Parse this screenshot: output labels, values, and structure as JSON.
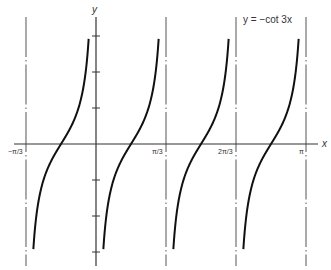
{
  "chart_data": {
    "type": "line",
    "title": "y = −cot 3x",
    "xlabel": "x",
    "ylabel": "y",
    "function": "y = -cot(3x)",
    "x_ticks": [
      {
        "value": -1.0472,
        "label": "−π/3"
      },
      {
        "value": 1.0472,
        "label": "π/3"
      },
      {
        "value": 2.0944,
        "label": "2π/3"
      },
      {
        "value": 3.1416,
        "label": "π"
      }
    ],
    "y_ticks": [
      -3,
      -2,
      -1,
      1,
      2,
      3
    ],
    "y_tick_labels_shown": false,
    "asymptotes_x": [
      -1.0472,
      0,
      1.0472,
      2.0944,
      3.1416
    ],
    "asymptote_labels": [
      "−π/3",
      "0",
      "π/3",
      "2π/3",
      "π"
    ],
    "branches": [
      {
        "from": -1.0472,
        "to": 0,
        "zero_at": -0.5236
      },
      {
        "from": 0,
        "to": 1.0472,
        "zero_at": 0.5236
      },
      {
        "from": 1.0472,
        "to": 2.0944,
        "zero_at": 1.5708
      },
      {
        "from": 2.0944,
        "to": 3.1416,
        "zero_at": 2.618
      }
    ],
    "sample_points": [
      {
        "x": -0.5236,
        "y": 0
      },
      {
        "x": 0.5236,
        "y": 0
      },
      {
        "x": 1.5708,
        "y": 0
      },
      {
        "x": 2.618,
        "y": 0
      },
      {
        "x": 0.2618,
        "y": -1
      },
      {
        "x": 0.7854,
        "y": 1
      }
    ],
    "xlim": [
      -1.2,
      3.4
    ],
    "ylim": [
      -3.4,
      3.5
    ],
    "curve_y_clip": 3.05,
    "grid": false,
    "legend": null,
    "asymptote_style": "dash-dot",
    "colors": {
      "curve": "#111111",
      "axis": "#333333",
      "asymptote": "#555555"
    }
  },
  "labels": {
    "y_axis": "y",
    "x_axis": "x",
    "equation": "y = −cot 3x",
    "tick_neg_pi_3": "−π/3",
    "tick_pi_3": "π/3",
    "tick_2pi_3": "2π/3",
    "tick_pi": "π"
  }
}
